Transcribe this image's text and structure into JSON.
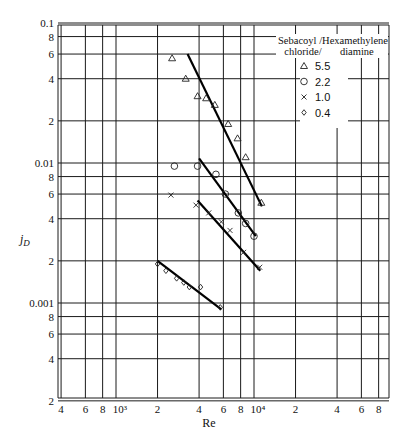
{
  "chart_data": {
    "type": "scatter",
    "title": "",
    "xlabel": "Re",
    "ylabel": "j_D",
    "xscale": "log",
    "yscale": "log",
    "xlim": [
      400,
      90000
    ],
    "ylim": [
      0.0002,
      0.1
    ],
    "grid": true,
    "x_tick_labels": [
      "4",
      "6",
      "8",
      "10³",
      "2",
      "4",
      "6",
      "8",
      "10⁴",
      "2",
      "4",
      "6",
      "8"
    ],
    "x_ticks": [
      400,
      600,
      800,
      1000,
      2000,
      4000,
      6000,
      8000,
      10000,
      20000,
      40000,
      60000,
      80000
    ],
    "y_tick_labels": [
      "0.1",
      "8",
      "6",
      "4",
      "2",
      "0.01",
      "8",
      "6",
      "4",
      "2",
      "0.001",
      "8",
      "6",
      "4",
      "2"
    ],
    "y_ticks": [
      0.1,
      0.08,
      0.06,
      0.04,
      0.02,
      0.01,
      0.008,
      0.006,
      0.004,
      0.002,
      0.001,
      0.0008,
      0.0006,
      0.0004,
      0.0002
    ],
    "legend": {
      "title_line1": "Sebacoyl /Hexamethylene",
      "title_line2": "chloride/       diamine",
      "position": "upper right"
    },
    "series": [
      {
        "name": "5.5",
        "marker": "triangle",
        "points": [
          [
            2550,
            0.056
          ],
          [
            3200,
            0.04
          ],
          [
            3900,
            0.03
          ],
          [
            4500,
            0.029
          ],
          [
            5200,
            0.026
          ],
          [
            6500,
            0.019
          ],
          [
            7600,
            0.015
          ],
          [
            8700,
            0.011
          ],
          [
            11300,
            0.0052
          ]
        ],
        "fit": [
          [
            3300,
            0.06
          ],
          [
            11400,
            0.0049
          ]
        ]
      },
      {
        "name": "2.2",
        "marker": "circle",
        "points": [
          [
            2650,
            0.0095
          ],
          [
            3900,
            0.0095
          ],
          [
            5300,
            0.0083
          ],
          [
            6200,
            0.006
          ],
          [
            7700,
            0.0044
          ],
          [
            8700,
            0.0037
          ],
          [
            10000,
            0.003
          ]
        ],
        "fit": [
          [
            4000,
            0.0108
          ],
          [
            10300,
            0.003
          ]
        ]
      },
      {
        "name": "1.0",
        "marker": "x",
        "points": [
          [
            2500,
            0.0059
          ],
          [
            3800,
            0.005
          ],
          [
            4700,
            0.0044
          ],
          [
            5800,
            0.0038
          ],
          [
            6700,
            0.0033
          ],
          [
            8400,
            0.0023
          ],
          [
            11000,
            0.0018
          ]
        ],
        "fit": [
          [
            3900,
            0.0054
          ],
          [
            11100,
            0.0017
          ]
        ]
      },
      {
        "name": "0.4",
        "marker": "diamond",
        "points": [
          [
            2000,
            0.0019
          ],
          [
            2300,
            0.0017
          ],
          [
            2750,
            0.0015
          ],
          [
            3100,
            0.0014
          ],
          [
            3400,
            0.0013
          ],
          [
            4100,
            0.0013
          ],
          [
            5700,
            0.00093
          ]
        ],
        "fit": [
          [
            2000,
            0.002
          ],
          [
            5800,
            0.0009
          ]
        ]
      }
    ]
  }
}
